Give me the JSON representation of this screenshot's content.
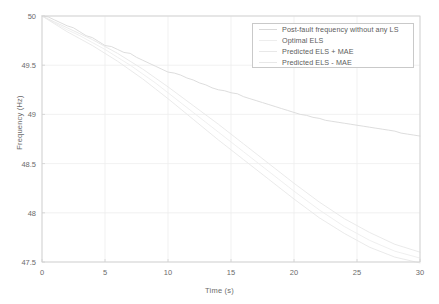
{
  "chart_data": {
    "type": "line",
    "title": "",
    "xlabel": "Time (s)",
    "ylabel": "Frequency (Hz)",
    "xlim": [
      0,
      30
    ],
    "ylim": [
      47.5,
      50
    ],
    "xticks": [
      0,
      5,
      10,
      15,
      20,
      25,
      30
    ],
    "yticks": [
      47.5,
      48,
      48.5,
      49,
      49.5,
      50
    ],
    "xticklabels": [
      "0",
      "5",
      "10",
      "15",
      "20",
      "25",
      "30"
    ],
    "yticklabels": [
      "47.5",
      "48",
      "48.5",
      "49",
      "49.5",
      "50"
    ],
    "grid": true,
    "legend_position": "upper right",
    "series": [
      {
        "name": "Post-fault frequency without any LS",
        "color": "#d9d9d9",
        "x": [
          0,
          0.5,
          1,
          1.5,
          2,
          2.5,
          3,
          3.5,
          4,
          4.5,
          5,
          5.5,
          6,
          6.5,
          7,
          7.5,
          8,
          8.5,
          9,
          9.5,
          10,
          10.5,
          11,
          11.5,
          12,
          12.5,
          13,
          13.5,
          14,
          14.5,
          15,
          15.5,
          16,
          16.5,
          17,
          17.5,
          18,
          18.5,
          19,
          19.5,
          20,
          20.5,
          21,
          21.5,
          22,
          22.5,
          23,
          23.5,
          24,
          24.5,
          25,
          25.5,
          26,
          26.5,
          27,
          27.5,
          28,
          28.5,
          29,
          29.5,
          30
        ],
        "y": [
          50.0,
          49.99,
          49.96,
          49.93,
          49.9,
          49.88,
          49.84,
          49.8,
          49.78,
          49.74,
          49.7,
          49.69,
          49.66,
          49.63,
          49.62,
          49.58,
          49.55,
          49.52,
          49.49,
          49.46,
          49.43,
          49.42,
          49.4,
          49.37,
          49.35,
          49.32,
          49.3,
          49.27,
          49.25,
          49.24,
          49.22,
          49.21,
          49.18,
          49.16,
          49.14,
          49.12,
          49.1,
          49.08,
          49.06,
          49.04,
          49.02,
          49.0,
          48.99,
          48.97,
          48.96,
          48.94,
          48.93,
          48.92,
          48.91,
          48.9,
          48.89,
          48.88,
          48.87,
          48.86,
          48.85,
          48.84,
          48.83,
          48.81,
          48.8,
          48.79,
          48.78
        ]
      },
      {
        "name": "Optimal ELS",
        "color": "#ededed",
        "x": [
          0,
          1,
          2,
          3,
          4,
          5,
          6,
          7,
          8,
          9,
          10,
          12,
          14,
          16,
          18,
          20,
          22,
          24,
          26,
          28,
          30
        ],
        "y": [
          50.0,
          49.93,
          49.86,
          49.8,
          49.73,
          49.66,
          49.58,
          49.5,
          49.41,
          49.32,
          49.22,
          49.02,
          48.82,
          48.62,
          48.42,
          48.22,
          48.03,
          47.86,
          47.72,
          47.61,
          47.54
        ]
      },
      {
        "name": "Predicted ELS + MAE",
        "color": "#e8e8e8",
        "x": [
          0,
          1,
          2,
          3,
          4,
          5,
          6,
          7,
          8,
          9,
          10,
          12,
          14,
          16,
          18,
          20,
          22,
          24,
          26,
          28,
          30
        ],
        "y": [
          50.0,
          49.94,
          49.88,
          49.82,
          49.76,
          49.69,
          49.62,
          49.54,
          49.46,
          49.37,
          49.28,
          49.09,
          48.9,
          48.7,
          48.5,
          48.3,
          48.11,
          47.94,
          47.8,
          47.68,
          47.6
        ]
      },
      {
        "name": "Predicted ELS - MAE",
        "color": "#e8e8e8",
        "x": [
          0,
          1,
          2,
          3,
          4,
          5,
          6,
          7,
          8,
          9,
          10,
          12,
          14,
          16,
          18,
          20,
          22,
          24,
          26,
          28,
          30
        ],
        "y": [
          50.0,
          49.92,
          49.84,
          49.77,
          49.7,
          49.62,
          49.54,
          49.45,
          49.36,
          49.26,
          49.16,
          48.95,
          48.74,
          48.54,
          48.34,
          48.14,
          47.95,
          47.79,
          47.65,
          47.55,
          47.49
        ]
      }
    ]
  },
  "legend": {
    "items": [
      {
        "label": "Post-fault frequency without any LS",
        "color": "#d9d9d9"
      },
      {
        "label": "Optimal ELS",
        "color": "#ededed"
      },
      {
        "label": "Predicted ELS + MAE",
        "color": "#e8e8e8"
      },
      {
        "label": "Predicted ELS - MAE",
        "color": "#e8e8e8"
      }
    ]
  },
  "axes": {
    "xlabel": "Time (s)",
    "ylabel": "Frequency (Hz)"
  },
  "colors": {
    "background": "#ffffff",
    "grid": "#ededed",
    "axis": "#d0d0d0",
    "text": "#6b6b6b",
    "legend_border": "#c9c9c9"
  }
}
